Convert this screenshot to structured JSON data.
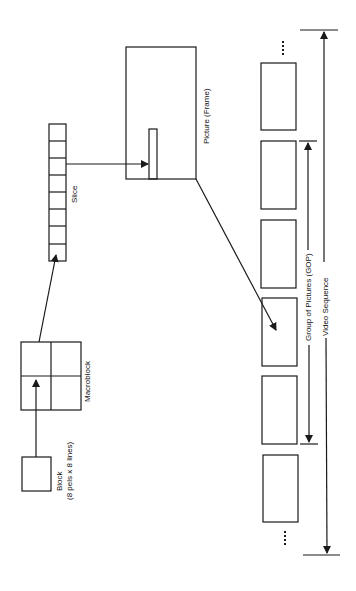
{
  "diagram": {
    "colors": {
      "stroke": "#1a1a1a",
      "background": "#ffffff"
    },
    "nodes": {
      "block": {
        "label": "Block",
        "sublabel": "(8 pels x 8 lines)"
      },
      "macroblock": {
        "label": "Macroblock"
      },
      "slice": {
        "label": "Slice",
        "cells": 8
      },
      "picture": {
        "label": "Picture (Frame)"
      },
      "sequence": {
        "frames": 6,
        "ellipsis_top": "⋮",
        "ellipsis_bottom": "⋮"
      }
    },
    "spans": {
      "gop": {
        "label": "Group of Pictures (GOP)"
      },
      "video_sequence": {
        "label": "Video Sequence"
      }
    },
    "edges": [
      {
        "from": "block",
        "to": "macroblock"
      },
      {
        "from": "macroblock",
        "to": "slice"
      },
      {
        "from": "slice",
        "to": "picture"
      },
      {
        "from": "picture",
        "to": "sequence-frame-4"
      }
    ]
  }
}
